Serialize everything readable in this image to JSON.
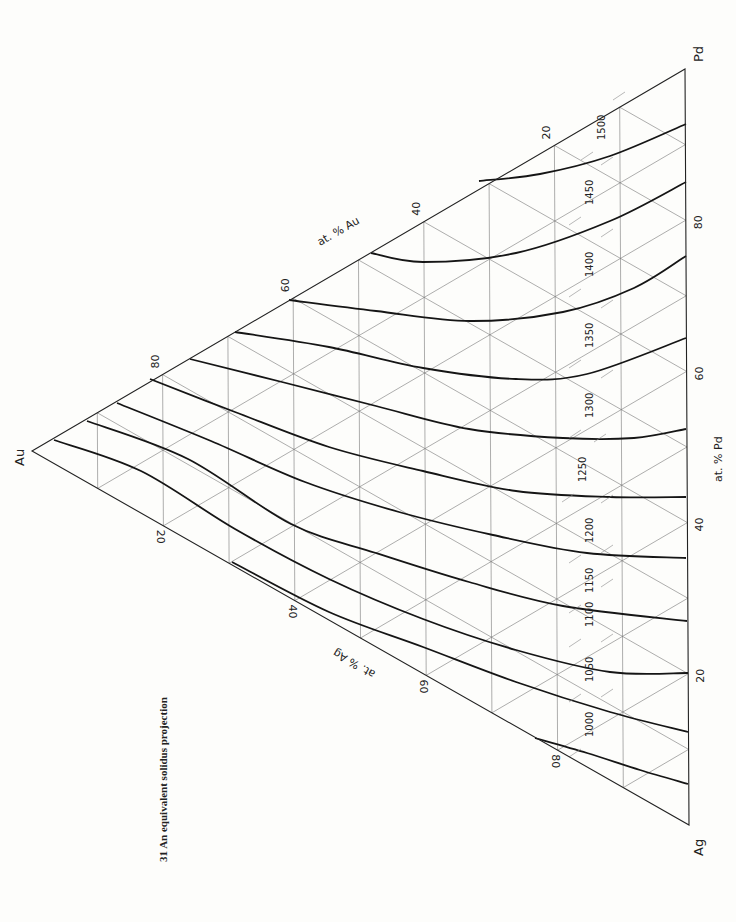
{
  "figure": {
    "caption": "31   An equivalent solidus projection",
    "vertices": {
      "au": {
        "label": "Au",
        "x": 32,
        "y": 451
      },
      "pd": {
        "label": "Pd",
        "x": 685,
        "y": 69
      },
      "ag": {
        "label": "Ag",
        "x": 689,
        "y": 825
      }
    },
    "axes": {
      "au_axis_label": "at. % Au",
      "pd_axis_label": "at. % Pd",
      "ag_axis_label": "at. % Ag",
      "ticks": [
        "20",
        "40",
        "60",
        "80"
      ]
    }
  },
  "chart_data": {
    "type": "ternary-contour",
    "title": "An equivalent solidus projection",
    "figure_number": "31",
    "components": [
      "Au",
      "Ag",
      "Pd"
    ],
    "axis_labels": [
      "at. % Au",
      "at. % Ag",
      "at. % Pd"
    ],
    "tick_values": [
      20,
      40,
      60,
      80
    ],
    "grid_interval_pct": 10,
    "isotherm_units": "°C",
    "isotherms": [
      {
        "value": 1000,
        "label": "1000",
        "points": [
          [
            535,
            738
          ],
          [
            587,
            753
          ],
          [
            640,
            770
          ],
          [
            688,
            784
          ]
        ]
      },
      {
        "value": 1050,
        "label": "1050",
        "points": [
          [
            232,
            562
          ],
          [
            329,
            612
          ],
          [
            423,
            647
          ],
          [
            516,
            682
          ],
          [
            610,
            712
          ],
          [
            688,
            732
          ]
        ]
      },
      {
        "value": 1100,
        "label": "1100",
        "points": [
          [
            54,
            440
          ],
          [
            141,
            471
          ],
          [
            235,
            529
          ],
          [
            329,
            579
          ],
          [
            423,
            619
          ],
          [
            516,
            650
          ],
          [
            610,
            672
          ],
          [
            688,
            673
          ]
        ]
      },
      {
        "value": 1150,
        "label": "1150",
        "points": [
          [
            87,
            421
          ],
          [
            188,
            459
          ],
          [
            291,
            524
          ],
          [
            376,
            553
          ],
          [
            469,
            582
          ],
          [
            563,
            606
          ],
          [
            687,
            621
          ]
        ]
      },
      {
        "value": 1200,
        "label": "1200",
        "points": [
          [
            117,
            403
          ],
          [
            211,
            441
          ],
          [
            305,
            482
          ],
          [
            399,
            512
          ],
          [
            493,
            535
          ],
          [
            587,
            553
          ],
          [
            686,
            558
          ]
        ]
      },
      {
        "value": 1250,
        "label": "1250",
        "points": [
          [
            150,
            379
          ],
          [
            235,
            412
          ],
          [
            329,
            447
          ],
          [
            423,
            471
          ],
          [
            516,
            491
          ],
          [
            610,
            497
          ],
          [
            686,
            497
          ]
        ]
      },
      {
        "value": 1300,
        "label": "1300",
        "points": [
          [
            190,
            359
          ],
          [
            282,
            382
          ],
          [
            376,
            406
          ],
          [
            469,
            429
          ],
          [
            563,
            438
          ],
          [
            634,
            438
          ],
          [
            686,
            429
          ]
        ]
      },
      {
        "value": 1350,
        "label": "1350",
        "points": [
          [
            235,
            332
          ],
          [
            329,
            347
          ],
          [
            423,
            368
          ],
          [
            516,
            379
          ],
          [
            587,
            374
          ],
          [
            686,
            338
          ]
        ]
      },
      {
        "value": 1400,
        "label": "1400",
        "points": [
          [
            289,
            300
          ],
          [
            376,
            311
          ],
          [
            470,
            321
          ],
          [
            563,
            312
          ],
          [
            634,
            288
          ],
          [
            686,
            256
          ]
        ]
      },
      {
        "value": 1450,
        "label": "1450",
        "points": [
          [
            371,
            253
          ],
          [
            423,
            262
          ],
          [
            516,
            253
          ],
          [
            610,
            221
          ],
          [
            686,
            182
          ]
        ]
      },
      {
        "value": 1500,
        "label": "1500",
        "points": [
          [
            479,
            181
          ],
          [
            540,
            174
          ],
          [
            610,
            156
          ],
          [
            686,
            124
          ]
        ]
      }
    ]
  }
}
